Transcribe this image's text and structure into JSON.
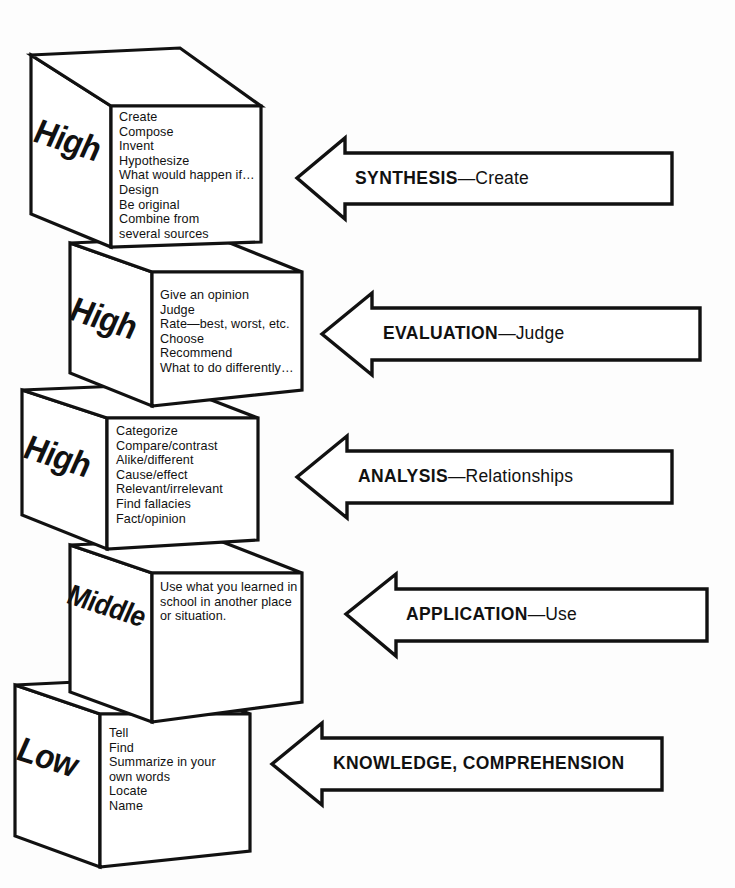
{
  "diagram": {
    "ink_color": "#111111",
    "paper_color": "#fdfdfd"
  },
  "levels": [
    {
      "id": "synthesis",
      "thinking_level": "High",
      "items_text": "Create\nCompose\nInvent\nHypothesize\nWhat would happen if…\nDesign\nBe original\nCombine from\nseveral sources",
      "items": [
        "Create",
        "Compose",
        "Invent",
        "Hypothesize",
        "What would happen if…",
        "Design",
        "Be original",
        "Combine from several sources"
      ],
      "arrow": {
        "name": "SYNTHESIS",
        "dash": "—",
        "descriptor": "Create"
      }
    },
    {
      "id": "evaluation",
      "thinking_level": "High",
      "items_text": "Give an opinion\nJudge\nRate—best, worst, etc.\nChoose\nRecommend\nWhat to do differently…",
      "items": [
        "Give an opinion",
        "Judge",
        "Rate—best, worst, etc.",
        "Choose",
        "Recommend",
        "What to do differently…"
      ],
      "arrow": {
        "name": "EVALUATION",
        "dash": "—",
        "descriptor": "Judge"
      }
    },
    {
      "id": "analysis",
      "thinking_level": "High",
      "items_text": "Categorize\nCompare/contrast\nAlike/different\nCause/effect\nRelevant/irrelevant\nFind fallacies\nFact/opinion",
      "items": [
        "Categorize",
        "Compare/contrast",
        "Alike/different",
        "Cause/effect",
        "Relevant/irrelevant",
        "Find fallacies",
        "Fact/opinion"
      ],
      "arrow": {
        "name": "ANALYSIS",
        "dash": "—",
        "descriptor": "Relationships"
      }
    },
    {
      "id": "application",
      "thinking_level": "Middle",
      "items_text": "Use what you learned in\nschool in another place\nor situation.",
      "items": [
        "Use what you learned in school in another place or situation."
      ],
      "arrow": {
        "name": "APPLICATION",
        "dash": "—",
        "descriptor": "Use"
      }
    },
    {
      "id": "knowledge",
      "thinking_level": "Low",
      "items_text": "Tell\nFind\nSummarize in your\nown words\nLocate\nName",
      "items": [
        "Tell",
        "Find",
        "Summarize in your own words",
        "Locate",
        "Name"
      ],
      "arrow": {
        "name": "KNOWLEDGE, COMPREHENSION",
        "dash": "",
        "descriptor": ""
      }
    }
  ]
}
